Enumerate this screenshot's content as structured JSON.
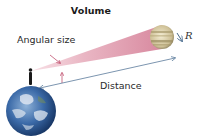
{
  "title": "Volume",
  "labels": {
    "angular_size": "Angular size",
    "distance": "Distance",
    "radius": "R"
  },
  "colors": {
    "cone": "#e7aebd",
    "arrow": "#5a7a9a",
    "pointer": "#c0506e",
    "earth_ocean": "#2f5f9e",
    "jupiter_band": "#c9b98a"
  }
}
